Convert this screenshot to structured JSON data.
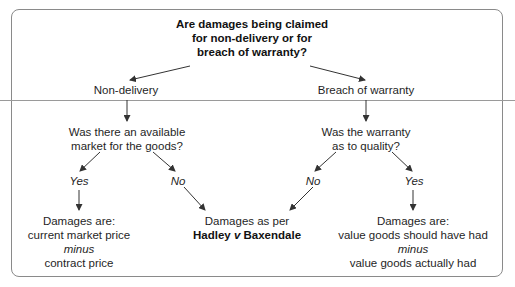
{
  "diagram": {
    "root_question": [
      "Are damages being claimed",
      "for non-delivery or for",
      "breach of warranty?"
    ],
    "left": {
      "label": "Non-delivery",
      "question": [
        "Was there an available",
        "market for the goods?"
      ],
      "yes_label": "Yes",
      "no_label": "No",
      "yes_result": {
        "line1": "Damages are:",
        "line2": "current market price",
        "line3": "minus",
        "line4": "contract price"
      }
    },
    "right": {
      "label": "Breach of warranty",
      "question": [
        "Was the warranty",
        "as to quality?"
      ],
      "no_label": "No",
      "yes_label": "Yes",
      "yes_result": {
        "line1": "Damages are:",
        "line2": "value goods should have had",
        "line3": "minus",
        "line4": "value goods actually had"
      }
    },
    "shared_result": {
      "line1": "Damages as per",
      "case_part1": "Hadley",
      "case_v": "v",
      "case_part2": "Baxendale"
    }
  }
}
